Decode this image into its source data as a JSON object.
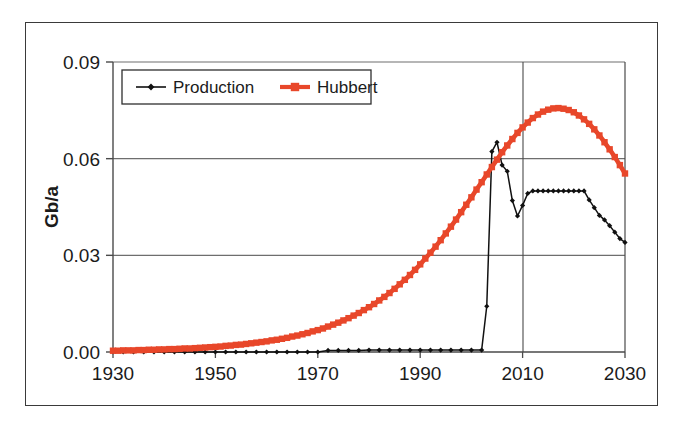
{
  "chart_data": {
    "type": "line",
    "title": "",
    "xlabel": "",
    "ylabel": "Gb/a",
    "xlim": [
      1930,
      2030
    ],
    "ylim": [
      0.0,
      0.09
    ],
    "grid": true,
    "legend_position": "top-left-inside",
    "x_ticks": [
      "1930",
      "1950",
      "1970",
      "1990",
      "2010",
      "2030"
    ],
    "x_tick_values": [
      1930,
      1950,
      1970,
      1990,
      2010,
      2030
    ],
    "y_ticks": [
      "0.00",
      "0.03",
      "0.06",
      "0.09"
    ],
    "y_tick_values": [
      0.0,
      0.03,
      0.06,
      0.09
    ],
    "series": [
      {
        "name": "Production",
        "color": "#111111",
        "marker": "diamond",
        "x": [
          1930,
          1932,
          1934,
          1936,
          1938,
          1940,
          1942,
          1944,
          1946,
          1948,
          1950,
          1952,
          1954,
          1956,
          1958,
          1960,
          1962,
          1964,
          1966,
          1968,
          1970,
          1972,
          1974,
          1976,
          1978,
          1980,
          1982,
          1984,
          1986,
          1988,
          1990,
          1992,
          1994,
          1996,
          1998,
          2000,
          2002,
          2003,
          2004,
          2005,
          2006,
          2007,
          2008,
          2009,
          2010,
          2011,
          2012,
          2013,
          2014,
          2015,
          2016,
          2017,
          2018,
          2019,
          2020,
          2021,
          2022,
          2023,
          2024,
          2025,
          2026,
          2027,
          2028,
          2029,
          2030
        ],
        "values": [
          0.0,
          0.0,
          0.0,
          0.0,
          0.0,
          0.0,
          0.0,
          0.0,
          0.0,
          0.0,
          0.0,
          0.0,
          0.0,
          0.0,
          0.0,
          0.0,
          0.0,
          0.0,
          0.0,
          0.0,
          0.0,
          0.0005,
          0.0005,
          0.0005,
          0.0005,
          0.0006,
          0.0006,
          0.0006,
          0.0006,
          0.0006,
          0.0006,
          0.0006,
          0.0006,
          0.0006,
          0.0006,
          0.0006,
          0.0006,
          0.0142,
          0.0622,
          0.0651,
          0.058,
          0.0561,
          0.047,
          0.0422,
          0.0455,
          0.0492,
          0.05,
          0.05,
          0.05,
          0.05,
          0.05,
          0.05,
          0.05,
          0.05,
          0.05,
          0.05,
          0.05,
          0.0472,
          0.0448,
          0.0424,
          0.041,
          0.0392,
          0.0372,
          0.0352,
          0.034
        ]
      },
      {
        "name": "Hubbert",
        "color": "#E8472A",
        "marker": "square",
        "x": [
          1930,
          1931,
          1932,
          1933,
          1934,
          1935,
          1936,
          1937,
          1938,
          1939,
          1940,
          1941,
          1942,
          1943,
          1944,
          1945,
          1946,
          1947,
          1948,
          1949,
          1950,
          1951,
          1952,
          1953,
          1954,
          1955,
          1956,
          1957,
          1958,
          1959,
          1960,
          1961,
          1962,
          1963,
          1964,
          1965,
          1966,
          1967,
          1968,
          1969,
          1970,
          1971,
          1972,
          1973,
          1974,
          1975,
          1976,
          1977,
          1978,
          1979,
          1980,
          1981,
          1982,
          1983,
          1984,
          1985,
          1986,
          1987,
          1988,
          1989,
          1990,
          1991,
          1992,
          1993,
          1994,
          1995,
          1996,
          1997,
          1998,
          1999,
          2000,
          2001,
          2002,
          2003,
          2004,
          2005,
          2006,
          2007,
          2008,
          2009,
          2010,
          2011,
          2012,
          2013,
          2014,
          2015,
          2016,
          2017,
          2018,
          2019,
          2020,
          2021,
          2022,
          2023,
          2024,
          2025,
          2026,
          2027,
          2028,
          2029,
          2030
        ],
        "values": [
          0.0004,
          0.0004,
          0.0005,
          0.0005,
          0.0005,
          0.0006,
          0.0006,
          0.0007,
          0.0007,
          0.0008,
          0.0008,
          0.0009,
          0.0009,
          0.001,
          0.0011,
          0.0011,
          0.0012,
          0.0013,
          0.0014,
          0.0015,
          0.0016,
          0.0017,
          0.0019,
          0.002,
          0.0022,
          0.0023,
          0.0025,
          0.0027,
          0.0029,
          0.0031,
          0.0033,
          0.0036,
          0.0038,
          0.0041,
          0.0044,
          0.0048,
          0.0051,
          0.0055,
          0.0059,
          0.0064,
          0.0068,
          0.0073,
          0.0079,
          0.0085,
          0.0091,
          0.0098,
          0.0105,
          0.0113,
          0.0121,
          0.013,
          0.0139,
          0.0149,
          0.016,
          0.0171,
          0.0183,
          0.0196,
          0.021,
          0.0224,
          0.0239,
          0.0255,
          0.0272,
          0.029,
          0.0308,
          0.0327,
          0.0347,
          0.0368,
          0.0389,
          0.0411,
          0.0434,
          0.0457,
          0.048,
          0.0504,
          0.0527,
          0.0551,
          0.0574,
          0.0597,
          0.062,
          0.0641,
          0.0661,
          0.068,
          0.0697,
          0.0712,
          0.0726,
          0.0737,
          0.0746,
          0.0752,
          0.0756,
          0.0757,
          0.0755,
          0.0751,
          0.0744,
          0.0734,
          0.0722,
          0.0708,
          0.0691,
          0.0672,
          0.0651,
          0.0629,
          0.0605,
          0.058,
          0.0554
        ]
      }
    ],
    "legend": [
      {
        "label": "Production",
        "color": "#111111",
        "marker": "diamond"
      },
      {
        "label": "Hubbert",
        "color": "#E8472A",
        "marker": "square"
      }
    ]
  },
  "axes": {
    "y_axis_title": "Gb/a"
  },
  "colors": {
    "hubbert_red": "#E8472A",
    "production_black": "#111111",
    "gridline": "#6e6e6e",
    "frame": "#3a3a3a"
  }
}
